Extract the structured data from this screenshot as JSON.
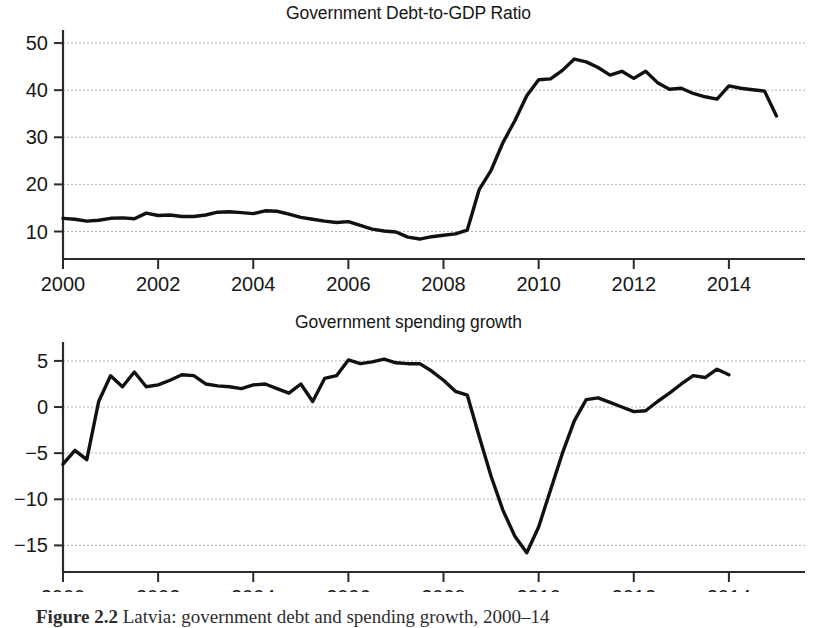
{
  "figure": {
    "caption_label": "Figure 2.2",
    "caption_text": "Latvia: government debt and spending growth, 2000–14"
  },
  "panels": [
    {
      "id": "debt",
      "title": "Government Debt-to-GDP Ratio",
      "y_ticks": [
        "10",
        "20",
        "30",
        "40",
        "50"
      ],
      "x_ticks": [
        "2000",
        "2002",
        "2004",
        "2006",
        "2008",
        "2010",
        "2012",
        "2014"
      ]
    },
    {
      "id": "spending",
      "title": "Government spending growth",
      "y_ticks": [
        "−15",
        "−10",
        "−5",
        "0",
        "5"
      ],
      "x_ticks": [
        "2000",
        "2002",
        "2004",
        "2006",
        "2008",
        "2010",
        "2012",
        "2014"
      ]
    }
  ],
  "chart_data": [
    {
      "type": "line",
      "title": "Government Debt-to-GDP Ratio",
      "xlabel": "",
      "ylabel": "",
      "xlim": [
        2000.0,
        2015.6
      ],
      "ylim": [
        6.5,
        51.5
      ],
      "yticks": [
        10,
        20,
        30,
        40,
        50
      ],
      "xticks": [
        2000,
        2002,
        2004,
        2006,
        2008,
        2010,
        2012,
        2014
      ],
      "grid": true,
      "legend": "none",
      "line_color": "#111111",
      "series": [
        {
          "name": "Government debt-to-GDP ratio (percent)",
          "x": [
            2000.0,
            2000.25,
            2000.5,
            2000.75,
            2001.0,
            2001.25,
            2001.5,
            2001.75,
            2002.0,
            2002.25,
            2002.5,
            2002.75,
            2003.0,
            2003.25,
            2003.5,
            2003.75,
            2004.0,
            2004.25,
            2004.5,
            2004.75,
            2005.0,
            2005.25,
            2005.5,
            2005.75,
            2006.0,
            2006.25,
            2006.5,
            2006.75,
            2007.0,
            2007.25,
            2007.5,
            2007.75,
            2008.0,
            2008.25,
            2008.5,
            2008.75,
            2009.0,
            2009.25,
            2009.5,
            2009.75,
            2010.0,
            2010.25,
            2010.5,
            2010.75,
            2011.0,
            2011.25,
            2011.5,
            2011.75,
            2012.0,
            2012.25,
            2012.5,
            2012.75,
            2013.0,
            2013.25,
            2013.5,
            2013.75,
            2014.0,
            2014.25,
            2014.5,
            2014.75,
            2015.0
          ],
          "y": [
            12.8,
            12.6,
            12.2,
            12.4,
            12.8,
            12.9,
            12.7,
            13.9,
            13.4,
            13.5,
            13.2,
            13.2,
            13.5,
            14.1,
            14.2,
            14.0,
            13.8,
            14.4,
            14.3,
            13.7,
            13.0,
            12.6,
            12.2,
            11.9,
            12.1,
            11.3,
            10.5,
            10.1,
            9.9,
            8.8,
            8.4,
            8.9,
            9.2,
            9.5,
            10.3,
            18.9,
            23.0,
            28.9,
            33.5,
            38.8,
            42.2,
            42.4,
            44.2,
            46.6,
            46.0,
            44.8,
            43.2,
            44.0,
            42.5,
            44.0,
            41.6,
            40.2,
            40.4,
            39.3,
            38.6,
            38.1,
            40.9,
            40.4,
            40.1,
            39.8,
            34.5
          ]
        }
      ]
    },
    {
      "type": "line",
      "title": "Government spending growth",
      "xlabel": "",
      "ylabel": "",
      "xlim": [
        2000.0,
        2015.6
      ],
      "ylim": [
        -16.8,
        6.4
      ],
      "yticks": [
        -15,
        -10,
        -5,
        0,
        5
      ],
      "xticks": [
        2000,
        2002,
        2004,
        2006,
        2008,
        2010,
        2012,
        2014
      ],
      "grid": true,
      "legend": "none",
      "line_color": "#111111",
      "series": [
        {
          "name": "Government spending growth (percent)",
          "x": [
            2000.0,
            2000.25,
            2000.5,
            2000.75,
            2001.0,
            2001.25,
            2001.5,
            2001.75,
            2002.0,
            2002.25,
            2002.5,
            2002.75,
            2003.0,
            2003.25,
            2003.5,
            2003.75,
            2004.0,
            2004.25,
            2004.5,
            2004.75,
            2005.0,
            2005.25,
            2005.5,
            2005.75,
            2006.0,
            2006.25,
            2006.5,
            2006.75,
            2007.0,
            2007.25,
            2007.5,
            2007.75,
            2008.0,
            2008.25,
            2008.5,
            2008.75,
            2009.0,
            2009.25,
            2009.5,
            2009.75,
            2010.0,
            2010.25,
            2010.5,
            2010.75,
            2011.0,
            2011.25,
            2011.5,
            2011.75,
            2012.0,
            2012.25,
            2012.5,
            2012.75,
            2013.0,
            2013.25,
            2013.5,
            2013.75,
            2014.0
          ],
          "y": [
            -6.2,
            -4.7,
            -5.7,
            0.6,
            3.4,
            2.2,
            3.8,
            2.2,
            2.4,
            2.9,
            3.5,
            3.4,
            2.5,
            2.3,
            2.2,
            2.0,
            2.4,
            2.5,
            2.0,
            1.5,
            2.5,
            0.6,
            3.1,
            3.4,
            5.1,
            4.7,
            4.9,
            5.2,
            4.8,
            4.7,
            4.7,
            3.9,
            2.9,
            1.7,
            1.3,
            -3.2,
            -7.5,
            -11.2,
            -14.0,
            -15.8,
            -13.0,
            -9.0,
            -5.0,
            -1.5,
            0.8,
            1.0,
            0.5,
            0.0,
            -0.5,
            -0.4,
            0.6,
            1.5,
            2.5,
            3.4,
            3.2,
            4.1,
            3.5
          ]
        }
      ]
    }
  ]
}
